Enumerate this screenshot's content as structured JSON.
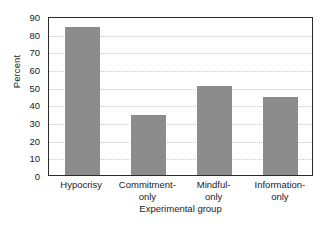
{
  "chart_data": {
    "type": "bar",
    "title": "",
    "xlabel": "Experimental group",
    "ylabel": "Percent",
    "categories": [
      "Hypocrisy",
      "Commitment-only",
      "Mindful-only",
      "Information-only"
    ],
    "category_lines": [
      [
        "Hypocrisy"
      ],
      [
        "Commitment-",
        "only"
      ],
      [
        "Mindful-",
        "only"
      ],
      [
        "Information-",
        "only"
      ]
    ],
    "values": [
      83.5,
      34,
      50.5,
      44
    ],
    "ylim": [
      0,
      90
    ],
    "ytick_step": 10,
    "yticks": [
      0,
      10,
      20,
      30,
      40,
      50,
      60,
      70,
      80,
      90
    ],
    "ytick_labels": [
      "0",
      "10",
      "20",
      "30",
      "40",
      "50",
      "60",
      "70",
      "80",
      "90"
    ],
    "grid": true,
    "grid_axis": "y",
    "grid_style": "dotted",
    "legend": null,
    "bar_color": "#8c8c8c",
    "grid_color": "#c9c9c9",
    "frame_color": "#2b2b2b",
    "background_color": "#ffffff"
  }
}
